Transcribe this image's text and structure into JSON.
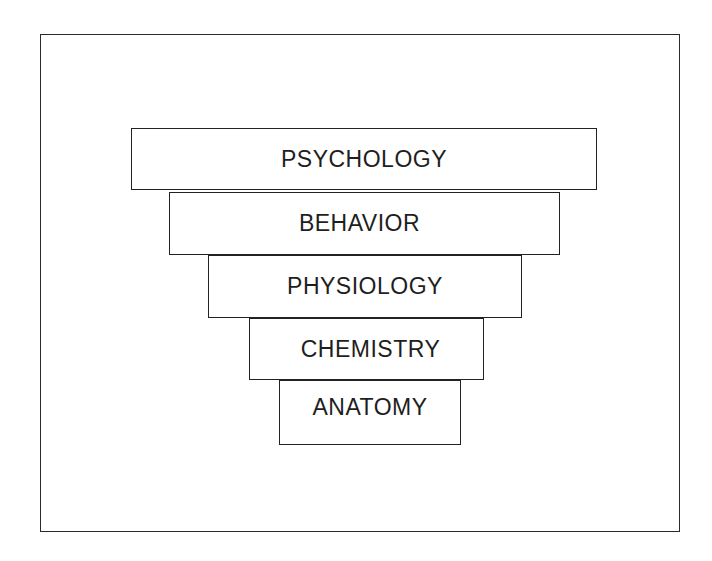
{
  "diagram": {
    "type": "inverted-pyramid",
    "layers": [
      {
        "label": "PSYCHOLOGY"
      },
      {
        "label": "BEHAVIOR"
      },
      {
        "label": "PHYSIOLOGY"
      },
      {
        "label": "CHEMISTRY"
      },
      {
        "label": "ANATOMY"
      }
    ],
    "colors": {
      "line": "#222222",
      "text": "#1e1e1e",
      "background": "#ffffff"
    }
  }
}
